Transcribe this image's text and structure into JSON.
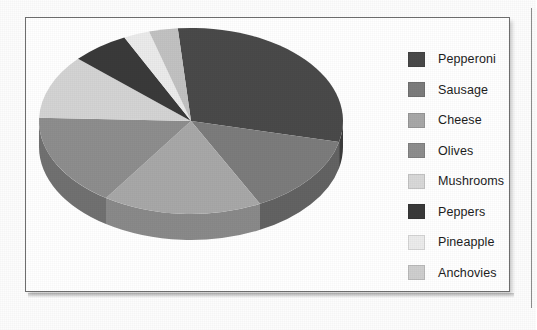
{
  "figure": {
    "panel_name": "pie-chart-figure"
  },
  "chart_data": {
    "type": "pie",
    "title": "",
    "subtitle": "",
    "xlabel": "",
    "ylabel": "",
    "grid": false,
    "legend_position": "right",
    "three_d": true,
    "depth_px": 26,
    "start_angle_deg": -95,
    "direction": "clockwise",
    "categories": [
      "Pepperoni",
      "Sausage",
      "Cheese",
      "Olives",
      "Mushrooms",
      "Peppers",
      "Pineapple",
      "Anchovies"
    ],
    "values": [
      30,
      14,
      17,
      16,
      11,
      6,
      3,
      3
    ],
    "percent_labels": [
      "30%",
      "14%",
      "17%",
      "16%",
      "11%",
      "6%",
      "3%",
      "3%"
    ],
    "slice_colors": [
      "#4a4a4a",
      "#7c7c7c",
      "#a8a8a8",
      "#8e8e8e",
      "#d4d4d4",
      "#3a3a3a",
      "#ebebeb",
      "#c2c2c2"
    ],
    "side_colors": [
      "#3b3b3b",
      "#636363",
      "#8a8a8a",
      "#717171",
      "#acacac",
      "#2e2e2e",
      "#c0c0c0",
      "#9d9d9d"
    ],
    "slices": [
      {
        "label": "Pepperoni",
        "value": 30,
        "color": "#4a4a4a",
        "side": "#3b3b3b",
        "start": -95,
        "end": 13
      },
      {
        "label": "Sausage",
        "value": 14,
        "color": "#7c7c7c",
        "side": "#636363",
        "start": 13,
        "end": 63
      },
      {
        "label": "Cheese",
        "value": 17,
        "color": "#a8a8a8",
        "side": "#8a8a8a",
        "start": 63,
        "end": 124
      },
      {
        "label": "Olives",
        "value": 16,
        "color": "#8e8e8e",
        "side": "#717171",
        "start": 124,
        "end": 182
      },
      {
        "label": "Mushrooms",
        "value": 11,
        "color": "#d4d4d4",
        "side": "#acacac",
        "start": 182,
        "end": 222
      },
      {
        "label": "Peppers",
        "value": 6,
        "color": "#3a3a3a",
        "side": "#2e2e2e",
        "start": 222,
        "end": 244
      },
      {
        "label": "Pineapple",
        "value": 3,
        "color": "#ebebeb",
        "side": "#c0c0c0",
        "start": 244,
        "end": 254
      },
      {
        "label": "Anchovies",
        "value": 3,
        "color": "#c2c2c2",
        "side": "#9d9d9d",
        "start": 254,
        "end": 265
      }
    ]
  },
  "legend": {
    "items": [
      {
        "label": "Pepperoni",
        "color": "#4a4a4a"
      },
      {
        "label": "Sausage",
        "color": "#7c7c7c"
      },
      {
        "label": "Cheese",
        "color": "#a8a8a8"
      },
      {
        "label": "Olives",
        "color": "#8e8e8e"
      },
      {
        "label": "Mushrooms",
        "color": "#d9d9d9"
      },
      {
        "label": "Peppers",
        "color": "#3a3a3a"
      },
      {
        "label": "Pineapple",
        "color": "#ececec"
      },
      {
        "label": "Anchovies",
        "color": "#cfcfcf"
      }
    ]
  }
}
